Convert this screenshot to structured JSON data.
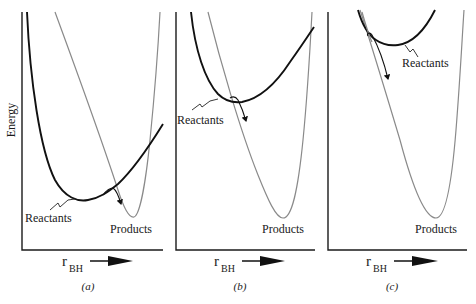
{
  "figure": {
    "y_axis_label": "Energy",
    "x_axis_symbol": "r",
    "x_axis_subscript": "BH",
    "colors": {
      "reactant_curve": "#111111",
      "product_curve": "#8a8a8a",
      "axes": "#1a1a1a"
    }
  },
  "panels": [
    {
      "id": "a",
      "caption": "(a)",
      "reactants_label": "Reactants",
      "products_label": "Products",
      "description": "Late barrier: reactant well lies left, crossing occurs near product side"
    },
    {
      "id": "b",
      "caption": "(b)",
      "reactants_label": "Reactants",
      "products_label": "Products",
      "description": "Crossing near reactant minimum"
    },
    {
      "id": "c",
      "caption": "(c)",
      "reactants_label": "Reactants",
      "products_label": "Products",
      "description": "Early crossing on the repulsive wall of the reactant curve"
    }
  ]
}
